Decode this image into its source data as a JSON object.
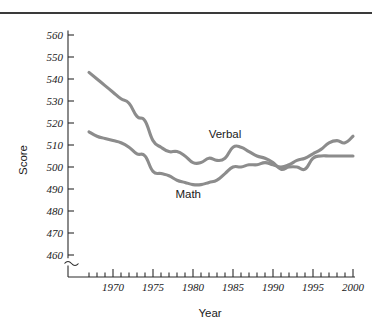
{
  "figure": {
    "top_rule": true,
    "background_color": "#ffffff"
  },
  "chart_data": {
    "type": "line",
    "title": "",
    "xlabel": "Year",
    "ylabel": "Score",
    "xlim": [
      1966.5,
      2000.5
    ],
    "ylim": [
      455,
      562
    ],
    "y_axis_break": true,
    "grid": false,
    "legend": "inline-labels",
    "y_ticks": [
      460,
      470,
      480,
      490,
      500,
      510,
      520,
      530,
      540,
      550,
      560
    ],
    "x_ticks_major": [
      1970,
      1975,
      1980,
      1985,
      1990,
      1995,
      2000
    ],
    "x_ticks_minor_step": 1,
    "line_color": "#8c8c8c",
    "x": [
      1967,
      1968,
      1969,
      1970,
      1971,
      1972,
      1973,
      1974,
      1975,
      1976,
      1977,
      1978,
      1979,
      1980,
      1981,
      1982,
      1983,
      1984,
      1985,
      1986,
      1987,
      1988,
      1989,
      1990,
      1991,
      1992,
      1993,
      1994,
      1995,
      1996,
      1997,
      1998,
      1999,
      2000
    ],
    "series": [
      {
        "name": "Verbal",
        "label": "Verbal",
        "values": [
          543,
          540,
          537,
          534,
          531,
          529,
          523,
          521,
          512,
          509,
          507,
          507,
          505,
          502,
          502,
          504,
          503,
          504,
          509,
          509,
          507,
          505,
          504,
          502,
          499,
          500,
          500,
          499,
          504,
          505,
          505,
          505,
          505,
          505
        ]
      },
      {
        "name": "Math",
        "label": "Math",
        "values": [
          516,
          514,
          513,
          512,
          511,
          509,
          506,
          505,
          498,
          497,
          496,
          494,
          493,
          492,
          492,
          493,
          494,
          497,
          500,
          500,
          501,
          501,
          502,
          501,
          500,
          501,
          503,
          504,
          506,
          508,
          511,
          512,
          511,
          514
        ]
      }
    ],
    "annotations": [
      {
        "text": "Verbal",
        "x": 1984.0,
        "y": 513
      },
      {
        "text": "Math",
        "x": 1979.4,
        "y": 486
      }
    ]
  }
}
